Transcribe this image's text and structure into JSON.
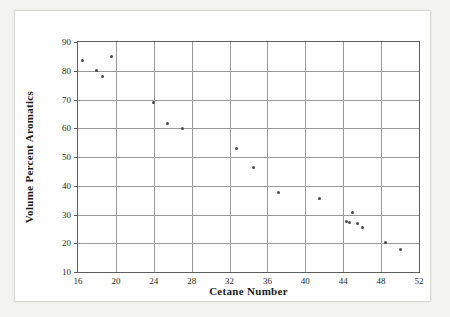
{
  "chart_data": {
    "type": "scatter",
    "title": "",
    "xlabel": "Cetane Number",
    "ylabel": "Volume Percent Aromatics",
    "xlim": [
      16,
      52
    ],
    "ylim": [
      10,
      90
    ],
    "xticks": [
      16,
      20,
      24,
      28,
      32,
      36,
      40,
      44,
      48,
      52
    ],
    "yticks": [
      10,
      20,
      30,
      40,
      50,
      60,
      70,
      80,
      90
    ],
    "grid": true,
    "legend": null,
    "marker_color": "#4a4a4a",
    "points": [
      {
        "x": 16.5,
        "y": 83.5
      },
      {
        "x": 18.0,
        "y": 80.0
      },
      {
        "x": 18.6,
        "y": 78.0
      },
      {
        "x": 19.5,
        "y": 85.0
      },
      {
        "x": 24.0,
        "y": 69.0
      },
      {
        "x": 25.5,
        "y": 61.5
      },
      {
        "x": 27.0,
        "y": 60.0
      },
      {
        "x": 32.7,
        "y": 53.0
      },
      {
        "x": 34.5,
        "y": 46.5
      },
      {
        "x": 37.2,
        "y": 37.5
      },
      {
        "x": 41.5,
        "y": 35.5
      },
      {
        "x": 44.3,
        "y": 27.7
      },
      {
        "x": 44.7,
        "y": 27.2
      },
      {
        "x": 45.0,
        "y": 30.7
      },
      {
        "x": 45.5,
        "y": 26.9
      },
      {
        "x": 46.0,
        "y": 25.5
      },
      {
        "x": 48.5,
        "y": 20.2
      },
      {
        "x": 50.0,
        "y": 17.7
      }
    ]
  }
}
